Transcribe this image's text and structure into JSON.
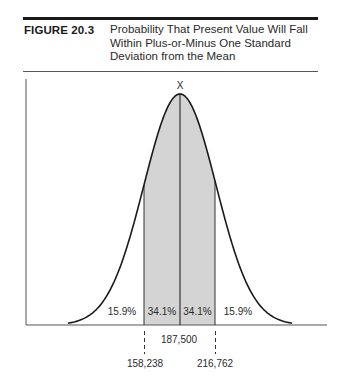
{
  "figure": {
    "label": "FIGURE 20.3",
    "caption": "Probability That Present Value Will Fall Within Plus-or-Minus One Standard Deviation from the Mean"
  },
  "chart_data": {
    "type": "area",
    "title": "Probability That Present Value Will Fall Within Plus-or-Minus One Standard Deviation from the Mean",
    "distribution": "normal",
    "mean_label": "X",
    "mean": 187500,
    "minus_one_sd": 158238,
    "plus_one_sd": 216762,
    "regions": [
      {
        "name": "left-tail",
        "label": "15.9%",
        "value": 15.9,
        "shaded": false
      },
      {
        "name": "left-center",
        "label": "34.1%",
        "value": 34.1,
        "shaded": true
      },
      {
        "name": "right-center",
        "label": "34.1%",
        "value": 34.1,
        "shaded": true
      },
      {
        "name": "right-tail",
        "label": "15.9%",
        "value": 15.9,
        "shaded": false
      }
    ],
    "x_ticks": [
      {
        "label": "158,238",
        "value": 158238
      },
      {
        "label": "187,500",
        "value": 187500
      },
      {
        "label": "216,762",
        "value": 216762
      }
    ],
    "xlabel": "",
    "ylabel": "",
    "grid": false,
    "legend": "none",
    "colors": {
      "shaded": "#d4d4d4",
      "line": "#1a1a1a"
    }
  }
}
